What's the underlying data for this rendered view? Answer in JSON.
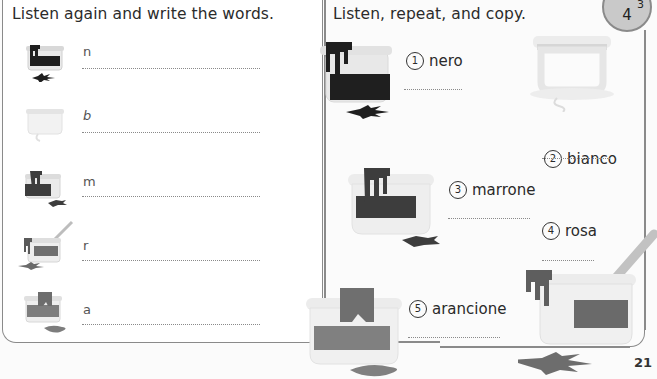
{
  "page": {
    "number": "21",
    "badge": {
      "main": "4",
      "superscript": "3"
    }
  },
  "left_panel": {
    "heading": "Listen again and write the words.",
    "rows": [
      {
        "letter": "n",
        "jar_color": "black",
        "paint_hex": "#1f1f1f"
      },
      {
        "letter": "b",
        "jar_color": "white",
        "paint_hex": "#f0f0f0"
      },
      {
        "letter": "m",
        "jar_color": "brown",
        "paint_hex": "#3d3d3d"
      },
      {
        "letter": "r",
        "jar_color": "pink",
        "paint_hex": "#6f6f6f"
      },
      {
        "letter": "a",
        "jar_color": "orange",
        "paint_hex": "#7d7d7d"
      }
    ]
  },
  "right_panel": {
    "heading": "Listen, repeat, and copy.",
    "items": [
      {
        "number": "1",
        "word": "nero",
        "paint_hex": "#1f1f1f"
      },
      {
        "number": "2",
        "word": "bianco",
        "paint_hex": "#eeeeee"
      },
      {
        "number": "3",
        "word": "marrone",
        "paint_hex": "#3d3d3d"
      },
      {
        "number": "4",
        "word": "rosa",
        "paint_hex": "#6a6a6a"
      },
      {
        "number": "5",
        "word": "arancione",
        "paint_hex": "#808080"
      }
    ]
  },
  "colors": {
    "border": "#8a8a8a",
    "jar_glass": "#e6e6e6",
    "jar_rim": "#d4d4d4",
    "badge_fill": "#c9c9c9"
  }
}
